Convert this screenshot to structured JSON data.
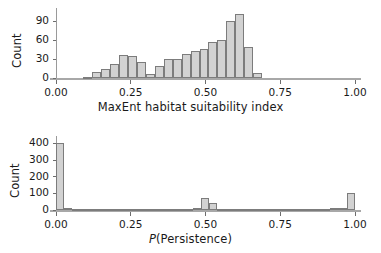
{
  "figure": {
    "background": "#ffffff",
    "bar_fill": "#d2d2d2",
    "bar_stroke": "#7c7c7c",
    "axis_color": "#9a9a9a"
  },
  "chart_data": [
    {
      "type": "bar",
      "id": "maxent-histogram",
      "title": "",
      "xlabel": "MaxEnt habitat suitability index",
      "ylabel": "Count",
      "xlim": [
        0.0,
        1.0
      ],
      "ylim": [
        0,
        105
      ],
      "grid": false,
      "legend": null,
      "xticks": [
        0.0,
        0.25,
        0.5,
        0.75,
        1.0
      ],
      "xtick_labels": [
        "0.00",
        "0.25",
        "0.50",
        "0.75",
        "1.00"
      ],
      "yticks": [
        0,
        30,
        60,
        90
      ],
      "ytick_labels": [
        "0",
        "30",
        "60",
        "90"
      ],
      "bin_width": 0.03,
      "bins": [
        {
          "x0": 0.09,
          "x1": 0.12,
          "value": 2
        },
        {
          "x0": 0.12,
          "x1": 0.15,
          "value": 9
        },
        {
          "x0": 0.15,
          "x1": 0.18,
          "value": 14
        },
        {
          "x0": 0.18,
          "x1": 0.21,
          "value": 23
        },
        {
          "x0": 0.21,
          "x1": 0.24,
          "value": 36
        },
        {
          "x0": 0.24,
          "x1": 0.27,
          "value": 35
        },
        {
          "x0": 0.27,
          "x1": 0.3,
          "value": 25
        },
        {
          "x0": 0.3,
          "x1": 0.33,
          "value": 7
        },
        {
          "x0": 0.33,
          "x1": 0.36,
          "value": 19
        },
        {
          "x0": 0.36,
          "x1": 0.39,
          "value": 30
        },
        {
          "x0": 0.39,
          "x1": 0.42,
          "value": 30
        },
        {
          "x0": 0.42,
          "x1": 0.45,
          "value": 38
        },
        {
          "x0": 0.45,
          "x1": 0.48,
          "value": 43
        },
        {
          "x0": 0.48,
          "x1": 0.51,
          "value": 46
        },
        {
          "x0": 0.51,
          "x1": 0.54,
          "value": 58
        },
        {
          "x0": 0.54,
          "x1": 0.57,
          "value": 61
        },
        {
          "x0": 0.57,
          "x1": 0.6,
          "value": 90
        },
        {
          "x0": 0.6,
          "x1": 0.63,
          "value": 102
        },
        {
          "x0": 0.63,
          "x1": 0.66,
          "value": 50
        },
        {
          "x0": 0.66,
          "x1": 0.69,
          "value": 8
        }
      ]
    },
    {
      "type": "bar",
      "id": "persistence-histogram",
      "title": "",
      "xlabel": "P(Persistence)",
      "xlabel_italic_prefix": "P",
      "ylabel": "Count",
      "xlim": [
        0.0,
        1.0
      ],
      "ylim": [
        0,
        420
      ],
      "grid": false,
      "legend": null,
      "xticks": [
        0.0,
        0.25,
        0.5,
        0.75,
        1.0
      ],
      "xtick_labels": [
        "0.00",
        "0.25",
        "0.50",
        "0.75",
        "1.00"
      ],
      "yticks": [
        0,
        100,
        200,
        300,
        400
      ],
      "ytick_labels": [
        "0",
        "100",
        "200",
        "300",
        "400"
      ],
      "bin_width": 0.027,
      "bins": [
        {
          "x0": 0.0,
          "x1": 0.027,
          "value": 400
        },
        {
          "x0": 0.027,
          "x1": 0.054,
          "value": 12
        },
        {
          "x0": 0.054,
          "x1": 0.081,
          "value": 5
        },
        {
          "x0": 0.081,
          "x1": 0.108,
          "value": 4
        },
        {
          "x0": 0.108,
          "x1": 0.135,
          "value": 3
        },
        {
          "x0": 0.135,
          "x1": 0.162,
          "value": 3
        },
        {
          "x0": 0.162,
          "x1": 0.189,
          "value": 8
        },
        {
          "x0": 0.189,
          "x1": 0.216,
          "value": 4
        },
        {
          "x0": 0.216,
          "x1": 0.243,
          "value": 3
        },
        {
          "x0": 0.243,
          "x1": 0.27,
          "value": 3
        },
        {
          "x0": 0.27,
          "x1": 0.297,
          "value": 3
        },
        {
          "x0": 0.297,
          "x1": 0.324,
          "value": 4
        },
        {
          "x0": 0.324,
          "x1": 0.351,
          "value": 6
        },
        {
          "x0": 0.351,
          "x1": 0.378,
          "value": 4
        },
        {
          "x0": 0.378,
          "x1": 0.405,
          "value": 3
        },
        {
          "x0": 0.405,
          "x1": 0.432,
          "value": 3
        },
        {
          "x0": 0.432,
          "x1": 0.459,
          "value": 4
        },
        {
          "x0": 0.459,
          "x1": 0.486,
          "value": 10
        },
        {
          "x0": 0.486,
          "x1": 0.513,
          "value": 70
        },
        {
          "x0": 0.513,
          "x1": 0.54,
          "value": 45
        },
        {
          "x0": 0.54,
          "x1": 0.567,
          "value": 8
        },
        {
          "x0": 0.567,
          "x1": 0.594,
          "value": 5
        },
        {
          "x0": 0.594,
          "x1": 0.621,
          "value": 4
        },
        {
          "x0": 0.621,
          "x1": 0.648,
          "value": 3
        },
        {
          "x0": 0.648,
          "x1": 0.675,
          "value": 3
        },
        {
          "x0": 0.675,
          "x1": 0.702,
          "value": 4
        },
        {
          "x0": 0.702,
          "x1": 0.729,
          "value": 3
        },
        {
          "x0": 0.729,
          "x1": 0.756,
          "value": 3
        },
        {
          "x0": 0.756,
          "x1": 0.783,
          "value": 4
        },
        {
          "x0": 0.783,
          "x1": 0.81,
          "value": 3
        },
        {
          "x0": 0.81,
          "x1": 0.837,
          "value": 3
        },
        {
          "x0": 0.837,
          "x1": 0.864,
          "value": 5
        },
        {
          "x0": 0.864,
          "x1": 0.891,
          "value": 4
        },
        {
          "x0": 0.891,
          "x1": 0.918,
          "value": 6
        },
        {
          "x0": 0.918,
          "x1": 0.945,
          "value": 12
        },
        {
          "x0": 0.945,
          "x1": 0.972,
          "value": 10
        },
        {
          "x0": 0.972,
          "x1": 1.0,
          "value": 105
        }
      ]
    }
  ]
}
